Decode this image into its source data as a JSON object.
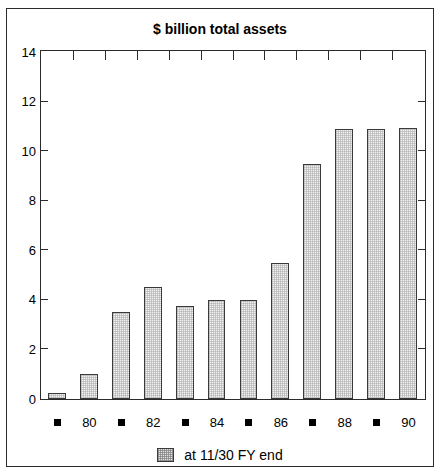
{
  "chart_data": {
    "type": "bar",
    "title": "$ billion total assets",
    "xlabel": "",
    "ylabel": "",
    "ylim": [
      0,
      14
    ],
    "ytick_values": [
      0,
      2,
      4,
      6,
      8,
      10,
      12,
      14
    ],
    "ytick_labels": [
      "0",
      "2",
      "4",
      "6",
      "8",
      "10",
      "12",
      "14"
    ],
    "grid": false,
    "legend_position": "bottom-center",
    "legend_entries": [
      "at 11/30 FY end"
    ],
    "categories": [
      "79",
      "80",
      "81",
      "82",
      "83",
      "84",
      "85",
      "86",
      "87",
      "88",
      "89",
      "90"
    ],
    "xtick_labels": [
      "■",
      "80",
      "■",
      "82",
      "■",
      "84",
      "■",
      "86",
      "■",
      "88",
      "■",
      "90"
    ],
    "xtick_is_marker": [
      true,
      false,
      true,
      false,
      true,
      false,
      true,
      false,
      true,
      false,
      true,
      false
    ],
    "values": [
      0.25,
      1.0,
      3.5,
      4.5,
      3.75,
      4.0,
      4.0,
      5.5,
      9.5,
      10.9,
      10.9,
      10.95
    ],
    "bar_fill_color": "#f2f2f2",
    "bar_edge_color": "#3a3a3a",
    "frame_color": "#2b2b2b",
    "background_color": "#ffffff"
  },
  "legend": {
    "label": "at 11/30 FY end",
    "swatch_name": "hatched-square-swatch"
  }
}
